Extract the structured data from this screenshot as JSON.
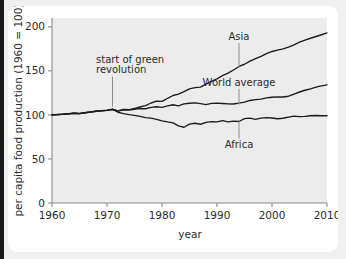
{
  "figure": {
    "background_color": "#ececec",
    "card_color": "#ffffff",
    "page_color": "#f0f0f0",
    "curve_color": "#1c1c1c",
    "axis_color": "#8a8a8a"
  },
  "chart_data": {
    "type": "line",
    "title": "",
    "xlabel": "year",
    "ylabel": "per capita food production (1960 = 100)",
    "xlim": [
      1960,
      2010
    ],
    "ylim": [
      0,
      210
    ],
    "xticks": [
      1960,
      1970,
      1980,
      1990,
      2000,
      2010
    ],
    "xtick_labels": [
      "1960",
      "1970",
      "1980",
      "1990",
      "2000",
      "2010"
    ],
    "yticks": [
      0,
      50,
      100,
      150,
      200
    ],
    "ytick_labels": [
      "0",
      "50",
      "100",
      "150",
      "200"
    ],
    "grid": false,
    "legend": "inline-labels",
    "x": [
      1960,
      1961,
      1962,
      1963,
      1964,
      1965,
      1966,
      1967,
      1968,
      1969,
      1970,
      1971,
      1972,
      1973,
      1974,
      1975,
      1976,
      1977,
      1978,
      1979,
      1980,
      1981,
      1982,
      1983,
      1984,
      1985,
      1986,
      1987,
      1988,
      1989,
      1990,
      1991,
      1992,
      1993,
      1994,
      1995,
      1996,
      1997,
      1998,
      1999,
      2000,
      2001,
      2002,
      2003,
      2004,
      2005,
      2006,
      2007,
      2008,
      2009,
      2010
    ],
    "series": [
      {
        "name": "Asia",
        "values": [
          100,
          100.5,
          100.8,
          101.3,
          102.0,
          101.6,
          102.6,
          103.4,
          104.3,
          104.8,
          105.5,
          106.4,
          104.6,
          106.3,
          106.0,
          107.5,
          109.0,
          110.6,
          113.5,
          115.7,
          115.3,
          118.8,
          122.0,
          123.5,
          126.4,
          129.5,
          131.0,
          131.6,
          135.0,
          138.0,
          141.0,
          144.5,
          147.5,
          151.0,
          155.0,
          157.5,
          161.0,
          164.0,
          166.5,
          169.5,
          172.0,
          173.5,
          175.0,
          177.0,
          179.5,
          182.5,
          185.0,
          187.0,
          189.0,
          191.0,
          193.0
        ],
        "label_x": 1994,
        "label_y": 185,
        "label_text": "Asia"
      },
      {
        "name": "World average",
        "values": [
          100,
          100.4,
          100.7,
          101.2,
          101.9,
          101.5,
          102.4,
          103.2,
          104.1,
          104.5,
          105.2,
          106.2,
          104.4,
          105.8,
          105.4,
          106.4,
          107.2,
          107.0,
          108.6,
          109.3,
          108.6,
          110.3,
          111.5,
          110.3,
          112.6,
          113.2,
          113.6,
          112.8,
          111.6,
          113.0,
          113.3,
          112.9,
          112.6,
          112.4,
          113.4,
          114.6,
          116.4,
          117.3,
          118.0,
          119.3,
          120.0,
          120.4,
          120.3,
          121.2,
          123.6,
          126.0,
          128.0,
          129.5,
          131.5,
          133.0,
          134.0
        ],
        "label_x": 1994,
        "label_y": 133,
        "label_text": "World average"
      },
      {
        "name": "Africa",
        "values": [
          100,
          100.4,
          100.7,
          101.2,
          101.9,
          101.5,
          102.4,
          103.2,
          104.1,
          104.5,
          105.2,
          106.2,
          103.0,
          101.5,
          100.4,
          99.5,
          98.4,
          97.0,
          96.3,
          95.0,
          93.2,
          92.0,
          91.0,
          87.5,
          86.0,
          89.5,
          90.5,
          89.4,
          91.5,
          92.3,
          92.0,
          93.5,
          92.0,
          93.0,
          92.5,
          95.8,
          96.3,
          95.0,
          96.3,
          97.0,
          96.5,
          95.6,
          96.2,
          97.5,
          98.6,
          98.0,
          98.4,
          99.0,
          99.3,
          99.0,
          99.0
        ],
        "label_x": 1994,
        "label_y": 63,
        "label_text": "Africa"
      }
    ],
    "annotations": [
      {
        "text_line1": "start of green",
        "text_line2": "revolution",
        "point_x": 1971,
        "point_y": 107,
        "text_x": 1968,
        "text_y": 148
      }
    ]
  }
}
